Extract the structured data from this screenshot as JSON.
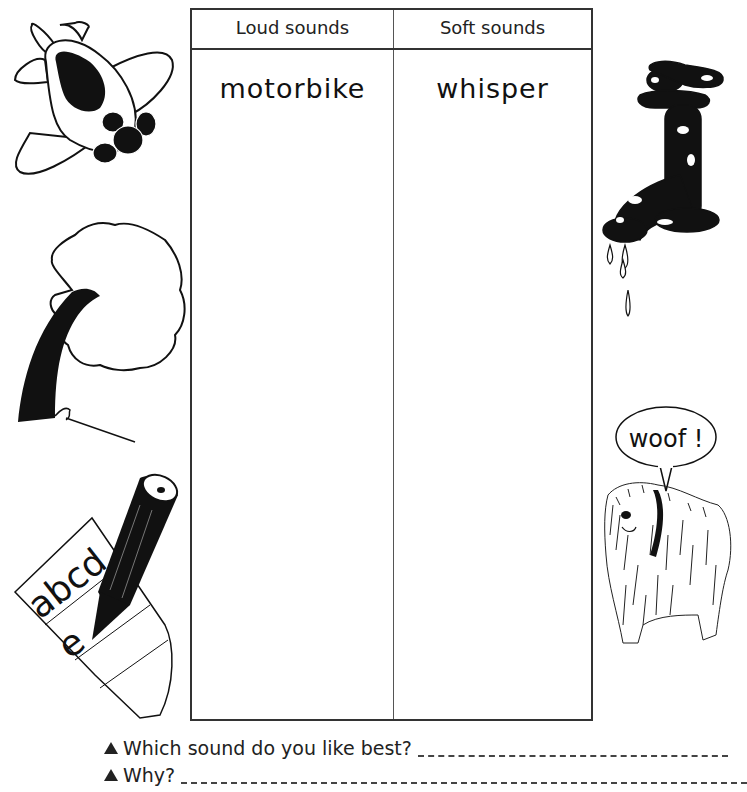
{
  "worksheet": {
    "table": {
      "columns": [
        {
          "header": "Loud sounds",
          "entries": [
            "motorbike"
          ]
        },
        {
          "header": "Soft sounds",
          "entries": [
            "whisper"
          ]
        }
      ]
    },
    "questions": [
      {
        "bullet": "triangle",
        "text": "Which sound do you like best?"
      },
      {
        "bullet": "triangle",
        "text": "Why?"
      }
    ],
    "illustrations": {
      "left": [
        "airplane",
        "tree",
        "pencil-and-paper"
      ],
      "right": [
        "dripping-tap",
        "barking-dog"
      ]
    },
    "speech_bubble": "woof !",
    "paper_letters": "abcd",
    "paper_letter_2": "e"
  }
}
